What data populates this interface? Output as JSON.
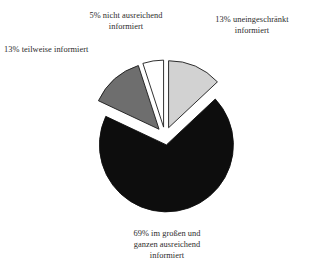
{
  "chart_data": {
    "type": "pie",
    "title": "",
    "subtitle": "",
    "xlabel": "",
    "ylabel": "",
    "legend_position": "none",
    "grid": false,
    "exploded": true,
    "units": "percent",
    "categories": [
      "uneingeschränkt informiert",
      "im großen und ganzen ausreichend informiert",
      "teilweise informiert",
      "nicht ausreichend informiert"
    ],
    "values": [
      13,
      69,
      13,
      5
    ],
    "slices": [
      {
        "key": "uneingeschraenkt",
        "percent": 13,
        "percent_text": "13%",
        "label": "uneingeschränkt informiert",
        "label_full": "13% uneingeschränkt informiert",
        "label_line_1": "13% uneingeschränkt",
        "label_line_2": "informiert",
        "color": "#d2d2d2",
        "outline": "#1a1a1a",
        "start_angle_deg": 0,
        "end_angle_deg": 46.8
      },
      {
        "key": "im-grossen-und-ganzen",
        "percent": 69,
        "percent_text": "69%",
        "label": "im großen und ganzen ausreichend informiert",
        "label_full": "69% im großen und ganzen ausreichend informiert",
        "label_line_1": "69% im großen und",
        "label_line_2": "ganzen ausreichend",
        "label_line_3": "informiert",
        "color": "#0d0d0d",
        "outline": "#0d0d0d",
        "start_angle_deg": 46.8,
        "end_angle_deg": 295.2
      },
      {
        "key": "teilweise",
        "percent": 13,
        "percent_text": "13%",
        "label": "teilweise informiert",
        "label_full": "13% teilweise informiert",
        "label_line_1": "13% teilweise informiert",
        "color": "#6e6e6e",
        "outline": "#1a1a1a",
        "start_angle_deg": 295.2,
        "end_angle_deg": 342.0
      },
      {
        "key": "nicht-ausreichend",
        "percent": 5,
        "percent_text": "5%",
        "label": "nicht ausreichend informiert",
        "label_full": "5% nicht ausreichend informiert",
        "label_line_1": "5% nicht ausreichend",
        "label_line_2": "informiert",
        "color": "#ffffff",
        "outline": "#1a1a1a",
        "start_angle_deg": 342.0,
        "end_angle_deg": 360.0
      }
    ],
    "background_color": "#ffffff",
    "text_color": "#2b2b2b"
  },
  "labels": {
    "top_middle": "5% nicht ausreichend\ninformiert",
    "top_right": "13% uneingeschränkt\ninformiert",
    "left": "13% teilweise informiert",
    "bottom": "69% im großen und\nganzen ausreichend\ninformiert"
  }
}
